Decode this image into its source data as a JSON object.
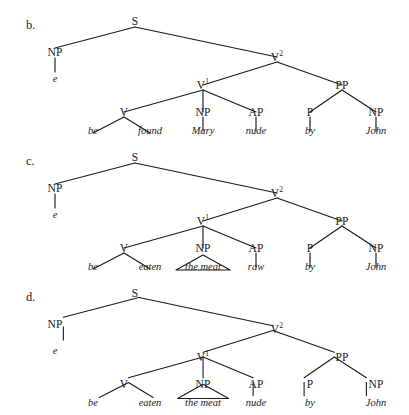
{
  "figure": {
    "background_color": "#ffffff",
    "ink_color": "#1a1a1a"
  },
  "trees": [
    {
      "id": "b",
      "label": "b.",
      "nodes": {
        "s": "S",
        "subject_np": "NP",
        "v2": "V",
        "v2_sup": "2",
        "v1": "V",
        "v1_sup": "1",
        "v": "V",
        "object_np": "NP",
        "ap": "AP",
        "pp": "PP",
        "p": "P",
        "pp_np": "NP"
      },
      "terminals": {
        "trace": "e",
        "aux": "be",
        "participle": "found",
        "object": "Mary",
        "adjective": "nude",
        "preposition": "by",
        "agent": "John"
      },
      "object_is_triangle": false
    },
    {
      "id": "c",
      "label": "c.",
      "nodes": {
        "s": "S",
        "subject_np": "NP",
        "v2": "V",
        "v2_sup": "2",
        "v1": "V",
        "v1_sup": "1",
        "v": "V",
        "object_np": "NP",
        "ap": "AP",
        "pp": "PP",
        "p": "P",
        "pp_np": "NP"
      },
      "terminals": {
        "trace": "e",
        "aux": "be",
        "participle": "eaten",
        "object": "the meat",
        "adjective": "raw",
        "preposition": "by",
        "agent": "John"
      },
      "object_is_triangle": true
    },
    {
      "id": "d",
      "label": "d.",
      "nodes": {
        "s": "S",
        "subject_np": "NP",
        "v2": "V",
        "v2_sup": "2",
        "v1": "V",
        "v1_sup": "1",
        "v": "V",
        "object_np": "NP",
        "ap": "AP",
        "pp": "PP",
        "p": "P",
        "pp_np": "NP"
      },
      "terminals": {
        "trace": "e",
        "aux": "be",
        "participle": "eaten",
        "object": "the meat",
        "adjective": "nude",
        "preposition": "by",
        "agent": "John"
      },
      "object_is_triangle": true
    }
  ]
}
